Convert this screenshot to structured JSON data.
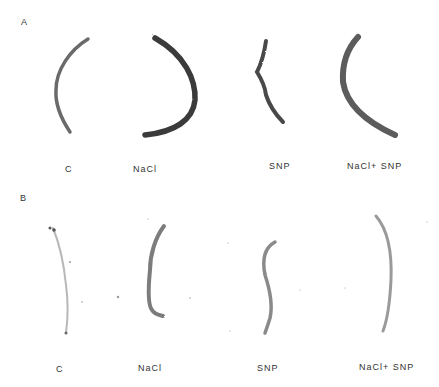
{
  "figure": {
    "panels": [
      {
        "label": "A",
        "captions": [
          "C",
          "NaCl",
          "SNP",
          "NaCl+ SNP"
        ]
      },
      {
        "label": "B",
        "captions": [
          "C",
          "NaCl",
          "SNP",
          "NaCl+ SNP"
        ]
      }
    ],
    "colors": {
      "background": "#ffffff",
      "panelA_stain": "#555555",
      "panelB_stain": "#888888"
    }
  }
}
